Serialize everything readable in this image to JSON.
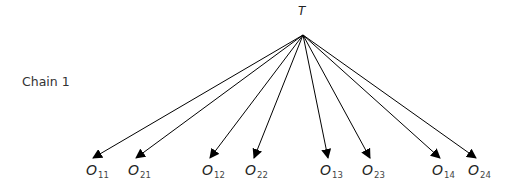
{
  "diagram": {
    "type": "tree",
    "chain_label": "Chain 1",
    "root": {
      "label": "T",
      "x": 303,
      "y": 35
    },
    "edge_color": "#000000",
    "nodes": [
      {
        "main": "O",
        "sub": "11",
        "tip_x": 93,
        "tip_y": 158,
        "label_x": 86
      },
      {
        "main": "O",
        "sub": "21",
        "tip_x": 136,
        "tip_y": 158,
        "label_x": 128
      },
      {
        "main": "O",
        "sub": "12",
        "tip_x": 210,
        "tip_y": 158,
        "label_x": 202
      },
      {
        "main": "O",
        "sub": "22",
        "tip_x": 254,
        "tip_y": 158,
        "label_x": 245
      },
      {
        "main": "O",
        "sub": "13",
        "tip_x": 328,
        "tip_y": 158,
        "label_x": 320
      },
      {
        "main": "O",
        "sub": "23",
        "tip_x": 370,
        "tip_y": 158,
        "label_x": 362
      },
      {
        "main": "O",
        "sub": "14",
        "tip_x": 440,
        "tip_y": 158,
        "label_x": 432
      },
      {
        "main": "O",
        "sub": "24",
        "tip_x": 476,
        "tip_y": 158,
        "label_x": 468
      }
    ]
  }
}
